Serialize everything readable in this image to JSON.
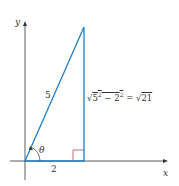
{
  "diagram": {
    "title": "",
    "axes": {
      "x_label": "x",
      "y_label": "y"
    },
    "triangle": {
      "hypotenuse_label": "5",
      "adjacent_label": "2",
      "opposite_label": "√(5² − 2²) = √21",
      "angle_label": "θ",
      "right_angle_marker": true
    },
    "formula": {
      "sqrt1": "√",
      "base1": "5",
      "exp1": "2",
      "minus": " − ",
      "base2": "2",
      "exp2": "2",
      "equals": " = ",
      "sqrt2": "√",
      "result": "21"
    },
    "colors": {
      "triangle": "#1f7fc8",
      "axes": "#333333",
      "right_angle": "#b03030",
      "text": "#333333"
    }
  }
}
